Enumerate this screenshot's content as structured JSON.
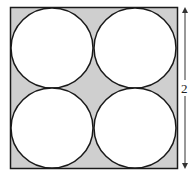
{
  "diagram": {
    "side_label": "2",
    "circles": 4,
    "colors": {
      "shade": "#cfcfcf",
      "stroke": "#1a1a1a",
      "circle_fill": "#ffffff"
    }
  }
}
